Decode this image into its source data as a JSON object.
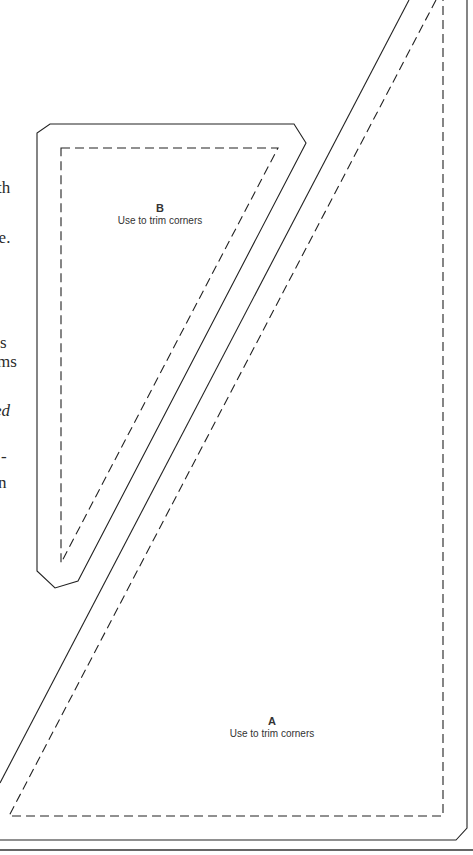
{
  "page": {
    "left_text_fragments": [
      {
        "text": "th",
        "top": 179,
        "left": -3,
        "italic": false
      },
      {
        "text": "se.",
        "top": 229,
        "left": -8,
        "italic": false
      },
      {
        "text": "s",
        "top": 334,
        "left": 0,
        "italic": false
      },
      {
        "text": "ms",
        "top": 353,
        "left": -3,
        "italic": false
      },
      {
        "text": "ed",
        "top": 402,
        "left": -6,
        "italic": true
      },
      {
        "text": "-",
        "top": 448,
        "left": 1,
        "italic": false
      },
      {
        "text": "n",
        "top": 474,
        "left": -2,
        "italic": false
      }
    ],
    "templates": {
      "A": {
        "letter": "A",
        "note": "Use to trim corners"
      },
      "B": {
        "letter": "B",
        "note": "Use to trim corners"
      }
    },
    "colors": {
      "line": "#222222",
      "background": "#ffffff"
    }
  }
}
